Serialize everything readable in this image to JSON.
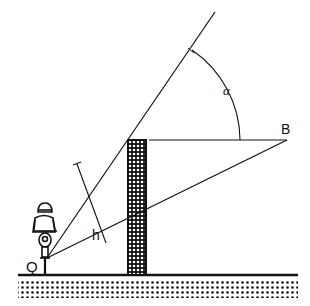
{
  "diagram": {
    "type": "geometry-figure",
    "labels": {
      "alpha": "α",
      "B": "B",
      "h": "h",
      "Q": "Q"
    },
    "colors": {
      "stroke": "#111111",
      "background": "#ffffff"
    },
    "geometry": {
      "observer_point": [
        47,
        258
      ],
      "upper_line_end": [
        215,
        12
      ],
      "point_B": [
        287,
        140
      ],
      "wall": {
        "x_left": 128,
        "x_right": 146,
        "top": 140,
        "bottom": 275
      },
      "ground_y": 275,
      "angle_arc_center": [
        130,
        140
      ],
      "angle_arc_radius": 110
    }
  }
}
